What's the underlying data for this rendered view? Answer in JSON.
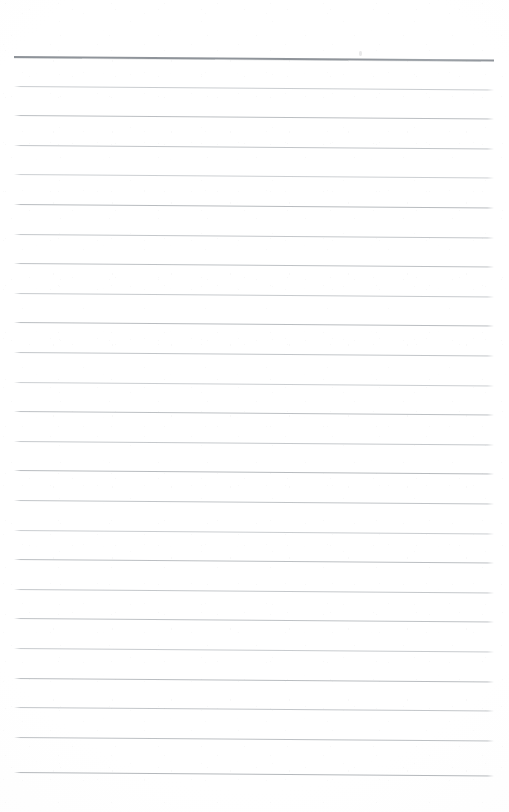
{
  "document": {
    "kind": "scanned-page",
    "subject": "blank ruled notebook paper",
    "page_width": 509,
    "page_height": 812,
    "background_color": "#ffffff",
    "text_content": "",
    "handwriting_present": false,
    "printed_text_present": false
  },
  "ruling": {
    "line_count": 25,
    "first_line_y": 56,
    "line_spacing": 29.6,
    "left_x": 14,
    "right_x": 494,
    "line_length": 480,
    "skew_drop_px": 3.6,
    "regular_line_color": "#b5b9bd",
    "regular_line_thickness": 1,
    "header_line_color": "#8a8f95",
    "header_line_thickness": 2,
    "header_line_index": 0,
    "lines": [
      {
        "index": 0,
        "y": 56,
        "emphasis": "header",
        "color": "#8a8f95",
        "thickness": 2,
        "opacity": 0.95
      },
      {
        "index": 1,
        "y": 85.6,
        "emphasis": "normal",
        "color": "#bcc0c4",
        "thickness": 1,
        "opacity": 0.8
      },
      {
        "index": 2,
        "y": 115.2,
        "emphasis": "normal",
        "color": "#b2b6ba",
        "thickness": 1,
        "opacity": 0.88
      },
      {
        "index": 3,
        "y": 144.8,
        "emphasis": "normal",
        "color": "#b6babe",
        "thickness": 1,
        "opacity": 0.84
      },
      {
        "index": 4,
        "y": 174.4,
        "emphasis": "normal",
        "color": "#bec2c6",
        "thickness": 1,
        "opacity": 0.78
      },
      {
        "index": 5,
        "y": 204.0,
        "emphasis": "normal",
        "color": "#b0b4b8",
        "thickness": 1,
        "opacity": 0.9
      },
      {
        "index": 6,
        "y": 233.6,
        "emphasis": "normal",
        "color": "#b8bcc0",
        "thickness": 1,
        "opacity": 0.83
      },
      {
        "index": 7,
        "y": 263.2,
        "emphasis": "normal",
        "color": "#b4b8bc",
        "thickness": 1,
        "opacity": 0.86
      },
      {
        "index": 8,
        "y": 292.8,
        "emphasis": "normal",
        "color": "#babec2",
        "thickness": 1,
        "opacity": 0.81
      },
      {
        "index": 9,
        "y": 322.4,
        "emphasis": "normal",
        "color": "#b1b5b9",
        "thickness": 1,
        "opacity": 0.89
      },
      {
        "index": 10,
        "y": 352.0,
        "emphasis": "normal",
        "color": "#b7bbbf",
        "thickness": 1,
        "opacity": 0.84
      },
      {
        "index": 11,
        "y": 381.6,
        "emphasis": "normal",
        "color": "#bdc1c5",
        "thickness": 1,
        "opacity": 0.78
      },
      {
        "index": 12,
        "y": 411.2,
        "emphasis": "normal",
        "color": "#b3b7bb",
        "thickness": 1,
        "opacity": 0.87
      },
      {
        "index": 13,
        "y": 440.8,
        "emphasis": "normal",
        "color": "#b9bdc1",
        "thickness": 1,
        "opacity": 0.82
      },
      {
        "index": 14,
        "y": 470.4,
        "emphasis": "normal",
        "color": "#b0b4b8",
        "thickness": 1,
        "opacity": 0.9
      },
      {
        "index": 15,
        "y": 500.0,
        "emphasis": "normal",
        "color": "#b6babe",
        "thickness": 1,
        "opacity": 0.85
      },
      {
        "index": 16,
        "y": 529.6,
        "emphasis": "normal",
        "color": "#bcc0c4",
        "thickness": 1,
        "opacity": 0.79
      },
      {
        "index": 17,
        "y": 559.2,
        "emphasis": "normal",
        "color": "#b2b6ba",
        "thickness": 1,
        "opacity": 0.88
      },
      {
        "index": 18,
        "y": 588.8,
        "emphasis": "normal",
        "color": "#b8bcc0",
        "thickness": 1,
        "opacity": 0.83
      },
      {
        "index": 19,
        "y": 618.4,
        "emphasis": "normal",
        "color": "#b4b8bc",
        "thickness": 1,
        "opacity": 0.86
      },
      {
        "index": 20,
        "y": 648.0,
        "emphasis": "normal",
        "color": "#babec2",
        "thickness": 1,
        "opacity": 0.8
      },
      {
        "index": 21,
        "y": 677.6,
        "emphasis": "normal",
        "color": "#b1b5b9",
        "thickness": 1,
        "opacity": 0.89
      },
      {
        "index": 22,
        "y": 707.2,
        "emphasis": "normal",
        "color": "#b7bbbf",
        "thickness": 1,
        "opacity": 0.84
      },
      {
        "index": 23,
        "y": 736.8,
        "emphasis": "normal",
        "color": "#b3b7bb",
        "thickness": 1,
        "opacity": 0.87
      },
      {
        "index": 24,
        "y": 772.0,
        "emphasis": "normal",
        "color": "#aeb2b6",
        "thickness": 1,
        "opacity": 0.92
      }
    ]
  },
  "margins": {
    "top_margin_px": 56,
    "bottom_margin_px": 40,
    "left_margin_px": 14,
    "right_margin_px": 15
  },
  "artifacts": {
    "speck_present": true,
    "speck_x": 359,
    "speck_y": 51,
    "speck_color": "#e9e9ea"
  }
}
